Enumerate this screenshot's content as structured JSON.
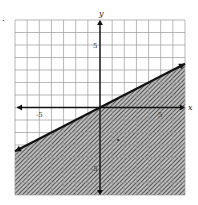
{
  "problem": {
    "number_label": "."
  },
  "chart_data": {
    "type": "line",
    "title": "",
    "subtitle": "Graph of linear inequality y ≤ (1/2)x",
    "xlabel": "x",
    "ylabel": "y",
    "xlim": [
      -7,
      7
    ],
    "ylim": [
      -7,
      7
    ],
    "grid": true,
    "grid_step": 1,
    "tick_labels": {
      "x": [
        {
          "value": -5,
          "label": "-5"
        },
        {
          "value": 5,
          "label": "5"
        }
      ],
      "y": [
        {
          "value": 5,
          "label": "5"
        },
        {
          "value": -5,
          "label": "-5"
        }
      ]
    },
    "series": [
      {
        "name": "boundary line y = x/2",
        "style": "solid",
        "arrows": "both",
        "x": [
          -7,
          7
        ],
        "y": [
          -3.5,
          3.5
        ]
      }
    ],
    "shading": {
      "region": "below",
      "inequality": "y <= x/2",
      "pattern": "hatched",
      "color": "#555555"
    },
    "annotations": [
      {
        "type": "point",
        "x": 1.5,
        "y": -2.6,
        "note": "small dot in shaded region"
      }
    ]
  },
  "colors": {
    "grid": "#9a9a9a",
    "axis": "#111111",
    "line": "#111111",
    "shade": "#6a6a6a"
  }
}
